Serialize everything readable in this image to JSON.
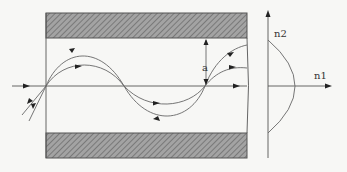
{
  "figure": {
    "title": "",
    "labels": {
      "dimension": "a",
      "axis_vertical": "n2",
      "axis_horizontal": "n1"
    },
    "components": {
      "upper_cladding": "hatched-bar",
      "lower_cladding": "hatched-bar",
      "core": "light-guiding region",
      "index_profile": "parabolic (graded index)"
    },
    "rays": [
      {
        "name": "axial-ray",
        "shape": "straight along axis"
      },
      {
        "name": "ray-1",
        "shape": "sinusoidal, large amplitude"
      },
      {
        "name": "ray-2",
        "shape": "sinusoidal, small amplitude"
      }
    ],
    "colors": {
      "hatch_fill": "#8a8a8a",
      "line": "#555555",
      "background": "#f7f7f5"
    }
  }
}
